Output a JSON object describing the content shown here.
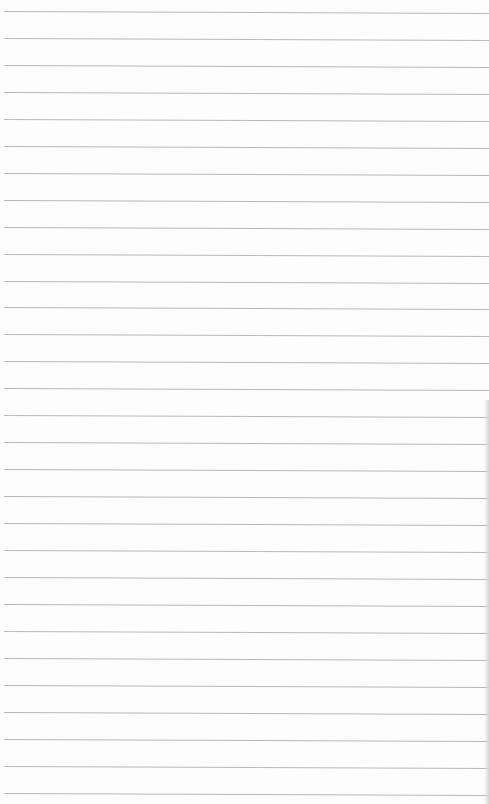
{
  "page": {
    "type": "lined-paper-sheet",
    "background_color": "#fdfdfd",
    "rule_color": "#b9b9b9",
    "rule_count": 30,
    "first_rule_y": 11,
    "rule_spacing": 26.95
  }
}
